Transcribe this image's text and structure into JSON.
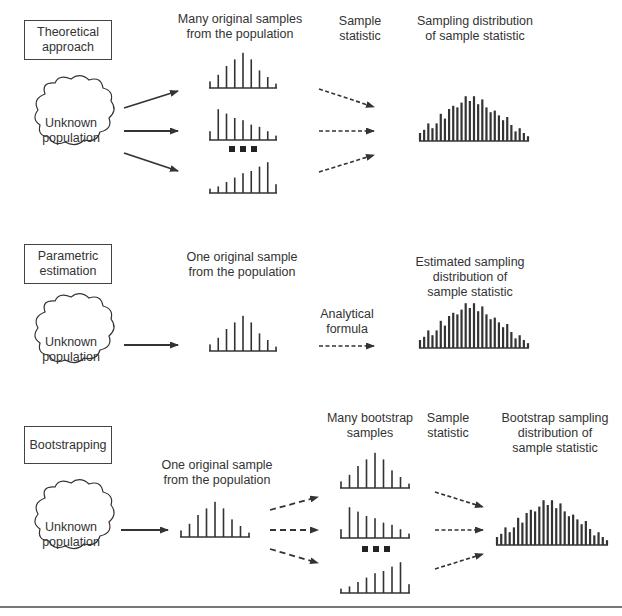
{
  "sections": [
    {
      "id": "theoretical",
      "title": "Theoretical\napproach",
      "population_label": "Unknown\npopulation",
      "column_headers": [
        "Many original samples\nfrom the population",
        "Sample\nstatistic",
        "Sampling distribution\nof sample statistic"
      ],
      "ellipsis": "■ ■ ■"
    },
    {
      "id": "parametric",
      "title": "Parametric\nestimation",
      "population_label": "Unknown\npopulation",
      "column_headers": [
        "One original sample\nfrom the population",
        "Analytical\nformula",
        "Estimated sampling\ndistribution of\nsample statistic"
      ]
    },
    {
      "id": "bootstrapping",
      "title": "Bootstrapping",
      "population_label": "Unknown\npopulation",
      "column_headers": [
        "One original sample\nfrom the population",
        "Many bootstrap\nsamples",
        "Sample\nstatistic",
        "Bootstrap sampling\ndistribution of\nsample statistic"
      ],
      "ellipsis": "■ ■ ■"
    }
  ],
  "histograms": {
    "sample_symmetric": [
      3,
      6,
      10,
      13,
      16,
      13,
      8,
      5,
      2
    ],
    "sample_left_skew": [
      4,
      14,
      12,
      10,
      9,
      7,
      6,
      4,
      2
    ],
    "sample_right_skew": [
      2,
      3,
      5,
      7,
      9,
      10,
      12,
      14,
      4
    ],
    "sampling_distribution": [
      5,
      7,
      11,
      8,
      11,
      17,
      14,
      20,
      22,
      21,
      24,
      28,
      25,
      28,
      23,
      26,
      21,
      18,
      19,
      16,
      13,
      15,
      10,
      6,
      8,
      5,
      3
    ]
  },
  "colors": {
    "line": "#333333",
    "text": "#333333",
    "background": "#ffffff"
  }
}
